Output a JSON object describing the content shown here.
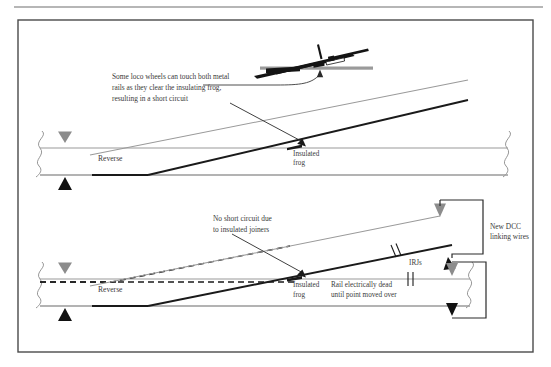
{
  "page": {
    "width": 551,
    "height": 367,
    "background": "#ffffff",
    "header_rule_color": "#6e6e6e",
    "frame_color": "#4a4a4a"
  },
  "colors": {
    "rail_black": "#1a1a1a",
    "rail_gray": "#9a9a9a",
    "rail_gray_light": "#b0b0b0",
    "text": "#3a3a3a",
    "wire": "#2a2a2a",
    "marker_gray": "#8c8c8c",
    "marker_black": "#111111"
  },
  "diagram": {
    "title_hidden": "",
    "upper": {
      "name": "insulated-frog-short-circuit",
      "callout": {
        "lines": [
          "Some loco wheels can touch both metal",
          "rails as they clear the insulating frog,",
          "resulting in a short circuit"
        ]
      },
      "frog_label": {
        "lines": [
          "Insulated",
          "frog"
        ]
      },
      "route_label": "Reverse",
      "loco_inset": {
        "name": "loco-wheel-detail",
        "description": "loco wheel bridging rails at insulated frog"
      },
      "markers": {
        "top": "gray-down-triangle",
        "bottom": "black-up-triangle"
      },
      "break_lines": [
        "left-squiggle-break",
        "right-squiggle-break"
      ]
    },
    "lower": {
      "name": "dcc-linking-wires-solution",
      "callout": {
        "lines": [
          "No short circuit due",
          "to insulated joiners"
        ]
      },
      "frog_label": {
        "lines": [
          "Insulated",
          "frog"
        ]
      },
      "route_label": "Reverse",
      "irj_label": "IRJs",
      "dead_rail_label": {
        "lines": [
          "Rail electrically dead",
          "until point moved over"
        ]
      },
      "wires_label": {
        "lines": [
          "New DCC",
          "linking wires"
        ]
      },
      "markers": {
        "top": "gray-down-triangle",
        "bottom": "black-up-triangle"
      },
      "break_lines": [
        "left-squiggle-break",
        "right-squiggle-break"
      ],
      "irj_marks": 3
    }
  }
}
